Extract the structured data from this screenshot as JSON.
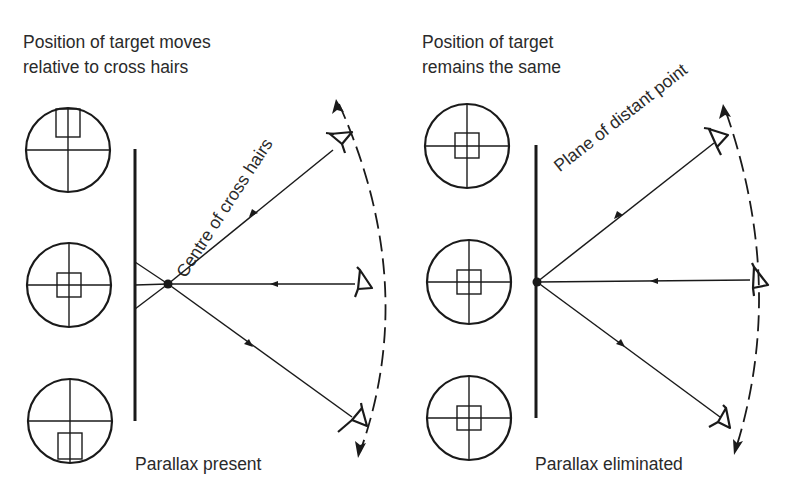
{
  "left_panel": {
    "heading_line1": "Position of target moves",
    "heading_line2": "relative to cross hairs",
    "diagonal_label": "Centre of cross hairs",
    "caption": "Parallax present",
    "reticles": [
      {
        "position": "top",
        "target_offset": "above centre"
      },
      {
        "position": "middle",
        "target_offset": "centred"
      },
      {
        "position": "bottom",
        "target_offset": "below centre"
      }
    ],
    "eyes": [
      "top",
      "middle",
      "bottom"
    ]
  },
  "right_panel": {
    "heading_line1": "Position of target",
    "heading_line2": "remains the same",
    "diagonal_label": "Plane of distant point",
    "caption": "Parallax eliminated",
    "reticles": [
      {
        "position": "top",
        "target_offset": "centred"
      },
      {
        "position": "middle",
        "target_offset": "centred"
      },
      {
        "position": "bottom",
        "target_offset": "centred"
      }
    ],
    "eyes": [
      "top",
      "middle",
      "bottom"
    ]
  },
  "colors": {
    "ink": "#1a1a1a",
    "background": "#ffffff"
  }
}
